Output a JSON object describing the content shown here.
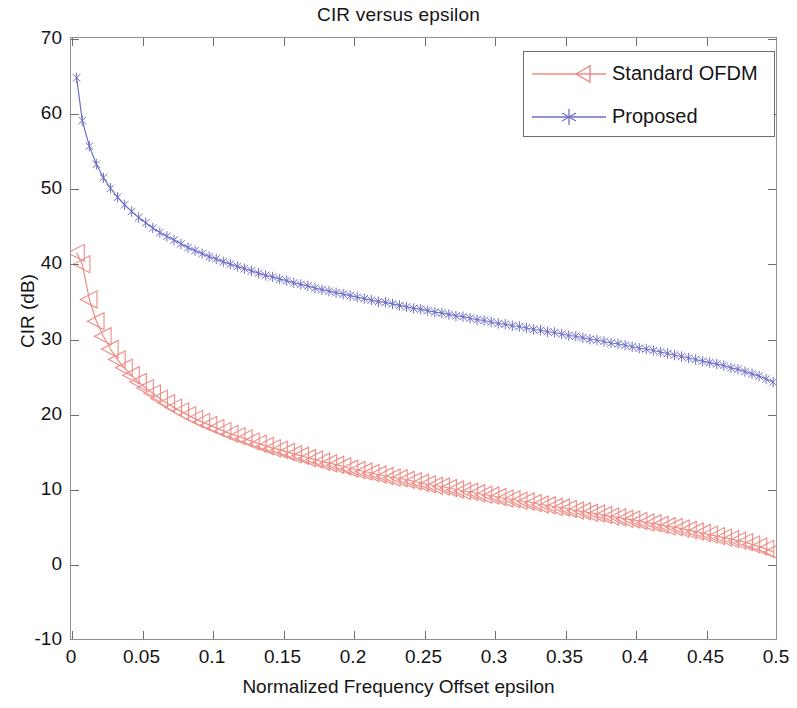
{
  "chart_data": {
    "type": "line",
    "title": "CIR versus epsilon",
    "xlabel": "Normalized Frequency Offset epsilon",
    "ylabel": "CIR (dB)",
    "xlim": [
      0,
      0.5
    ],
    "ylim": [
      -10,
      70
    ],
    "xticks": [
      0,
      0.05,
      0.1,
      0.15,
      0.2,
      0.25,
      0.3,
      0.35,
      0.4,
      0.45,
      0.5
    ],
    "xtick_labels": [
      "0",
      "0.05",
      "0.1",
      "0.15",
      "0.2",
      "0.25",
      "0.3",
      "0.35",
      "0.4",
      "0.45",
      "0.5"
    ],
    "yticks": [
      -10,
      0,
      10,
      20,
      30,
      40,
      50,
      60,
      70
    ],
    "ytick_labels": [
      "-10",
      "0",
      "10",
      "20",
      "30",
      "40",
      "50",
      "60",
      "70"
    ],
    "grid": false,
    "legend_position": "upper right",
    "series": [
      {
        "name": "Standard OFDM",
        "color": "#ef8b85",
        "marker": "left-triangle",
        "x": [
          0.004,
          0.008,
          0.013,
          0.018,
          0.023,
          0.028,
          0.033,
          0.038,
          0.043,
          0.048,
          0.053,
          0.058,
          0.063,
          0.068,
          0.073,
          0.078,
          0.083,
          0.088,
          0.093,
          0.098,
          0.103,
          0.108,
          0.113,
          0.118,
          0.123,
          0.128,
          0.133,
          0.138,
          0.143,
          0.148,
          0.153,
          0.158,
          0.163,
          0.168,
          0.173,
          0.178,
          0.183,
          0.188,
          0.193,
          0.198,
          0.203,
          0.208,
          0.213,
          0.218,
          0.223,
          0.228,
          0.233,
          0.238,
          0.243,
          0.248,
          0.253,
          0.258,
          0.263,
          0.268,
          0.273,
          0.278,
          0.283,
          0.288,
          0.293,
          0.298,
          0.303,
          0.308,
          0.313,
          0.318,
          0.323,
          0.328,
          0.333,
          0.338,
          0.343,
          0.348,
          0.353,
          0.358,
          0.363,
          0.368,
          0.373,
          0.378,
          0.383,
          0.388,
          0.393,
          0.398,
          0.403,
          0.408,
          0.413,
          0.418,
          0.423,
          0.428,
          0.433,
          0.438,
          0.443,
          0.448,
          0.453,
          0.458,
          0.463,
          0.468,
          0.473,
          0.478,
          0.483,
          0.488,
          0.493,
          0.498
        ],
        "y": [
          41.4,
          39.9,
          35.2,
          32.3,
          30.3,
          28.6,
          27.2,
          26.1,
          25.1,
          24.2,
          23.4,
          22.7,
          22.0,
          21.4,
          20.8,
          20.3,
          19.8,
          19.3,
          18.9,
          18.5,
          18.1,
          17.7,
          17.3,
          17.0,
          16.7,
          16.3,
          16.0,
          15.7,
          15.4,
          15.2,
          14.9,
          14.6,
          14.4,
          14.1,
          13.9,
          13.6,
          13.4,
          13.2,
          13.0,
          12.7,
          12.5,
          12.3,
          12.1,
          11.9,
          11.7,
          11.5,
          11.4,
          11.2,
          11.0,
          10.8,
          10.6,
          10.4,
          10.3,
          10.1,
          9.9,
          9.7,
          9.6,
          9.4,
          9.2,
          9.1,
          8.9,
          8.7,
          8.6,
          8.4,
          8.3,
          8.1,
          7.9,
          7.8,
          7.6,
          7.5,
          7.3,
          7.1,
          7.0,
          6.8,
          6.7,
          6.5,
          6.3,
          6.2,
          6.0,
          5.9,
          5.7,
          5.5,
          5.4,
          5.2,
          5.0,
          4.9,
          4.7,
          4.5,
          4.3,
          4.1,
          3.9,
          3.7,
          3.5,
          3.3,
          3.1,
          2.9,
          2.6,
          2.3,
          2.0,
          1.6
        ]
      },
      {
        "name": "Proposed",
        "color": "#6e6ec8",
        "marker": "asterisk",
        "x": [
          0.004,
          0.008,
          0.013,
          0.018,
          0.023,
          0.028,
          0.033,
          0.038,
          0.043,
          0.048,
          0.053,
          0.058,
          0.063,
          0.068,
          0.073,
          0.078,
          0.083,
          0.088,
          0.093,
          0.098,
          0.103,
          0.108,
          0.113,
          0.118,
          0.123,
          0.128,
          0.133,
          0.138,
          0.143,
          0.148,
          0.153,
          0.158,
          0.163,
          0.168,
          0.173,
          0.178,
          0.183,
          0.188,
          0.193,
          0.198,
          0.203,
          0.208,
          0.213,
          0.218,
          0.223,
          0.228,
          0.233,
          0.238,
          0.243,
          0.248,
          0.253,
          0.258,
          0.263,
          0.268,
          0.273,
          0.278,
          0.283,
          0.288,
          0.293,
          0.298,
          0.303,
          0.308,
          0.313,
          0.318,
          0.323,
          0.328,
          0.333,
          0.338,
          0.343,
          0.348,
          0.353,
          0.358,
          0.363,
          0.368,
          0.373,
          0.378,
          0.383,
          0.388,
          0.393,
          0.398,
          0.403,
          0.408,
          0.413,
          0.418,
          0.423,
          0.428,
          0.433,
          0.438,
          0.443,
          0.448,
          0.453,
          0.458,
          0.463,
          0.468,
          0.473,
          0.478,
          0.483,
          0.488,
          0.493,
          0.498
        ],
        "y": [
          64.7,
          59.0,
          55.6,
          53.2,
          51.4,
          50.0,
          48.8,
          47.8,
          46.9,
          46.1,
          45.4,
          44.7,
          44.1,
          43.6,
          43.1,
          42.6,
          42.1,
          41.7,
          41.3,
          40.9,
          40.6,
          40.2,
          39.9,
          39.6,
          39.3,
          39.0,
          38.7,
          38.4,
          38.2,
          37.9,
          37.7,
          37.4,
          37.2,
          37.0,
          36.7,
          36.5,
          36.3,
          36.1,
          35.9,
          35.7,
          35.5,
          35.3,
          35.1,
          34.9,
          34.8,
          34.6,
          34.4,
          34.2,
          34.0,
          33.9,
          33.7,
          33.5,
          33.4,
          33.2,
          33.0,
          32.9,
          32.7,
          32.5,
          32.4,
          32.2,
          32.0,
          31.9,
          31.7,
          31.6,
          31.4,
          31.2,
          31.1,
          30.9,
          30.8,
          30.6,
          30.4,
          30.3,
          30.1,
          29.9,
          29.8,
          29.6,
          29.4,
          29.3,
          29.1,
          28.9,
          28.7,
          28.6,
          28.4,
          28.2,
          28.0,
          27.8,
          27.6,
          27.4,
          27.2,
          27.0,
          26.8,
          26.6,
          26.4,
          26.1,
          25.9,
          25.6,
          25.3,
          25.0,
          24.6,
          24.2
        ]
      }
    ]
  },
  "legend": {
    "entries": [
      {
        "label": "Standard OFDM"
      },
      {
        "label": "Proposed"
      }
    ]
  }
}
